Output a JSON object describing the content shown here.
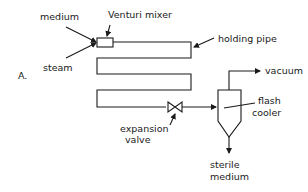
{
  "diagram": {
    "panel_label": "A.",
    "inputs": {
      "medium": "medium",
      "steam": "steam"
    },
    "components": {
      "venturi_mixer": "Venturi mixer",
      "holding_pipe": "holding pipe",
      "expansion_valve_line1": "expansion",
      "expansion_valve_line2": "valve",
      "flash_cooler_line1": "flash",
      "flash_cooler_line2": "cooler"
    },
    "outputs": {
      "vacuum": "vacuum",
      "sterile_medium_line1": "sterile",
      "sterile_medium_line2": "medium"
    },
    "colors": {
      "ink": "#1a1a1a",
      "background": "#ffffff"
    }
  }
}
